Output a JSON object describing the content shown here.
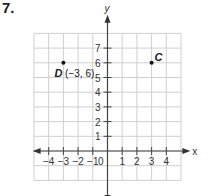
{
  "problem_number": "7.",
  "chart_data": {
    "type": "scatter",
    "title": "",
    "xlabel": "x",
    "ylabel": "y",
    "xlim": [
      -5,
      5
    ],
    "ylim": [
      -2,
      8
    ],
    "grid": true,
    "x_ticks": [
      "-4",
      "-3",
      "-2",
      "-1",
      "1",
      "2",
      "3",
      "4"
    ],
    "y_ticks": [
      "1",
      "2",
      "3",
      "4",
      "5",
      "6",
      "7"
    ],
    "origin_label": "0",
    "points": [
      {
        "label": "D",
        "coord_label": "(−3, 6)",
        "x": -3,
        "y": 6
      },
      {
        "label": "C",
        "coord_label": "",
        "x": 3,
        "y": 6
      }
    ]
  }
}
